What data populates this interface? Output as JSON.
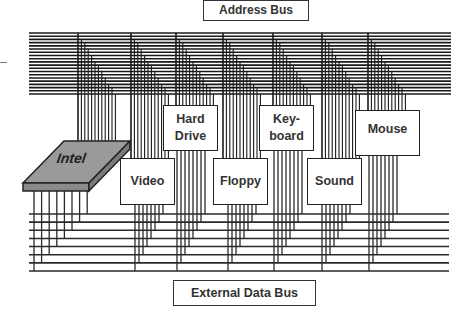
{
  "diagram": {
    "title_top": "Address Bus",
    "title_bottom": "External Data Bus",
    "cpu": {
      "label": "Intel",
      "fill": "#9a9a9a"
    },
    "devices": [
      {
        "id": "video",
        "label": "Video"
      },
      {
        "id": "hard-drive",
        "label": "Hard\nDrive"
      },
      {
        "id": "floppy",
        "label": "Floppy"
      },
      {
        "id": "keyboard",
        "label": "Key-\nboard"
      },
      {
        "id": "sound",
        "label": "Sound"
      },
      {
        "id": "mouse",
        "label": "Mouse"
      }
    ],
    "address_bus_lines": 20,
    "data_bus_lines": 8,
    "line_color": "#1a1a1a"
  }
}
